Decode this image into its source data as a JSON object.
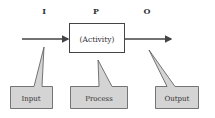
{
  "diagram": {
    "type": "IPO model",
    "headers": {
      "i": "I",
      "p": "P",
      "o": "O"
    },
    "box_label": "(Activity)",
    "callouts": {
      "input": "Input",
      "process": "Process",
      "output": "Output"
    },
    "colors": {
      "line": "#444444",
      "callout_fill": "#d4d4d4",
      "box_fill": "#ffffff"
    }
  }
}
